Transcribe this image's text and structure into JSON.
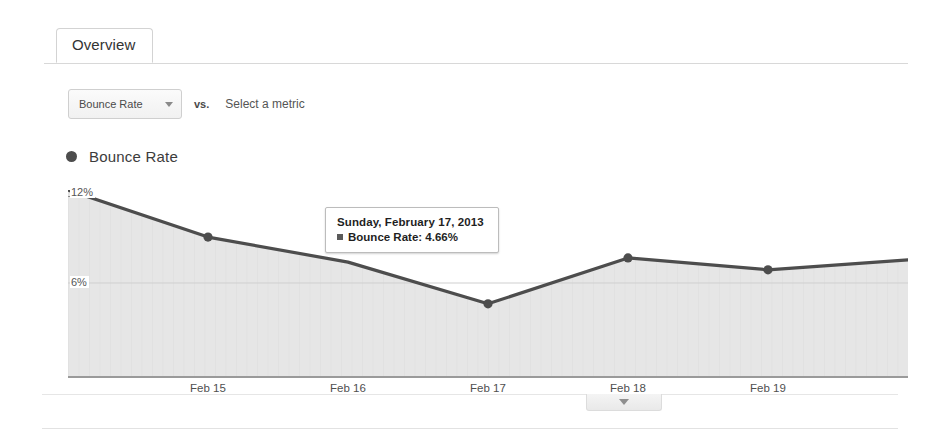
{
  "tabs": {
    "active": "Overview"
  },
  "controls": {
    "metric_button_label": "Bounce Rate",
    "vs_label": "vs.",
    "select_metric_label": "Select a metric",
    "caret_icon": "chevron-down-icon"
  },
  "legend": {
    "series_label": "Bounce Rate",
    "series_color": "#4d4d4d"
  },
  "tooltip": {
    "date": "Sunday, February 17, 2013",
    "metric_line": "Bounce Rate: 4.66%",
    "swatch_color": "#5a5a5a"
  },
  "footer": {
    "collapse_caret_icon": "chevron-down-icon"
  },
  "chart_data": {
    "type": "line",
    "title": "Bounce Rate",
    "xlabel": "",
    "ylabel": "",
    "grid": true,
    "legend_position": "top-left",
    "fill": true,
    "line_color": "#4d4d4d",
    "area_color": "#e4e4e4",
    "ylim": [
      0,
      12
    ],
    "yticks": [
      12,
      6
    ],
    "ytick_labels": [
      "12%",
      "6%"
    ],
    "categories": [
      "Feb 14",
      "Feb 15",
      "Feb 16",
      "Feb 17",
      "Feb 18",
      "Feb 19",
      "Feb 20"
    ],
    "xtick_labels": [
      "Feb 15",
      "Feb 16",
      "Feb 17",
      "Feb 18",
      "Feb 19"
    ],
    "series": [
      {
        "name": "Bounce Rate",
        "values": [
          12.0,
          8.96,
          7.35,
          4.66,
          7.62,
          6.85,
          7.5
        ]
      }
    ],
    "highlighted_point": {
      "category": "Feb 17",
      "value": 4.66,
      "label": "4.66%"
    }
  }
}
